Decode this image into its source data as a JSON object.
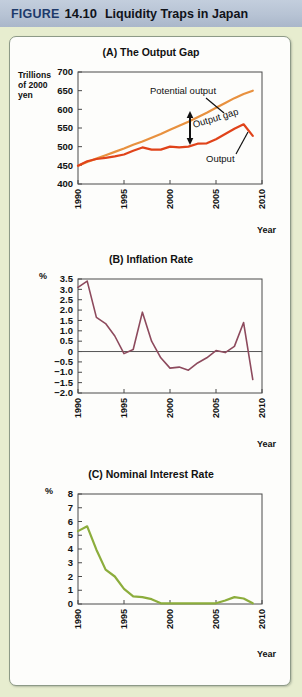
{
  "header": {
    "kicker": "FIGURE",
    "number": "14.10",
    "title": "Liquidity Traps in Japan"
  },
  "colors": {
    "header_band": "#b7c3d4",
    "page_background": "#e7edcf",
    "panel_background": "#fdfdfb",
    "potential_output_line": "#e8913f",
    "output_line": "#e0431a",
    "inflation_line": "#8d4a5d",
    "interest_line": "#8cad3c",
    "axis": "#4a4a4a",
    "zero_line": "#555555"
  },
  "chart_data": [
    {
      "type": "line",
      "id": "output-gap",
      "title": "(A) The Output Gap",
      "ylabel": "Trillions of 2000 yen",
      "ylabel_lines": [
        "Trillions",
        "of 2000",
        "yen"
      ],
      "xlabel": "Year",
      "ylim": [
        400,
        700
      ],
      "yticks": [
        400,
        450,
        500,
        550,
        600,
        650,
        700
      ],
      "xlim": [
        1990,
        2010
      ],
      "xticks": [
        1990,
        1995,
        2000,
        2005,
        2010
      ],
      "xtick_labels": [
        "1990",
        "1995",
        "2000",
        "2005",
        "2010"
      ],
      "grid": false,
      "legend": "inline-annotations",
      "annotations": [
        {
          "text": "Potential output",
          "x": 1996.5,
          "y": 648
        },
        {
          "text": "Output gap",
          "x": 2002.0,
          "y": 556
        },
        {
          "text": "Output",
          "x": 2005.0,
          "y": 492
        }
      ],
      "x": [
        1990,
        1991,
        1992,
        1993,
        1994,
        1995,
        1996,
        1997,
        1998,
        1999,
        2000,
        2001,
        2002,
        2003,
        2004,
        2005,
        2006,
        2007,
        2008,
        2009
      ],
      "series": [
        {
          "name": "Potential output",
          "color": "#e8913f",
          "values": [
            449,
            459,
            468,
            477,
            486,
            495,
            505,
            514,
            524,
            534,
            545,
            556,
            567,
            579,
            591,
            604,
            617,
            630,
            641,
            650
          ]
        },
        {
          "name": "Output",
          "color": "#e0431a",
          "values": [
            449,
            461,
            467,
            470,
            474,
            479,
            489,
            498,
            492,
            492,
            500,
            498,
            500,
            508,
            509,
            520,
            534,
            548,
            560,
            529
          ]
        }
      ]
    },
    {
      "type": "line",
      "id": "inflation-rate",
      "title": "(B) Inflation Rate",
      "ylabel": "%",
      "xlabel": "Year",
      "ylim": [
        -2.0,
        3.5
      ],
      "yticks": [
        3.5,
        3.0,
        2.5,
        2.0,
        1.5,
        1.0,
        0.5,
        0,
        -0.5,
        -1.0,
        -1.5,
        -2.0
      ],
      "ytick_labels": [
        "3.5",
        "3.0",
        "2.5",
        "2.0",
        "1.5",
        "1.0",
        "0.5",
        "0",
        "−0.5",
        "−1.0",
        "−1.5",
        "−2.0"
      ],
      "xlim": [
        1990,
        2010
      ],
      "xticks": [
        1990,
        1995,
        2000,
        2005,
        2010
      ],
      "xtick_labels": [
        "1990",
        "1995",
        "2000",
        "2005",
        "2010"
      ],
      "grid": false,
      "zero_line": true,
      "x": [
        1990,
        1991,
        1992,
        1993,
        1994,
        1995,
        1996,
        1997,
        1998,
        1999,
        2000,
        2001,
        2002,
        2003,
        2004,
        2005,
        2006,
        2007,
        2008,
        2009
      ],
      "series": [
        {
          "name": "Inflation rate",
          "color": "#8d4a5d",
          "values": [
            3.1,
            3.4,
            1.65,
            1.35,
            0.75,
            -0.1,
            0.1,
            1.9,
            0.5,
            -0.3,
            -0.8,
            -0.75,
            -0.9,
            -0.55,
            -0.3,
            0.05,
            -0.05,
            0.25,
            1.4,
            -1.35
          ]
        }
      ]
    },
    {
      "type": "line",
      "id": "nominal-interest-rate",
      "title": "(C) Nominal Interest Rate",
      "ylabel": "%",
      "xlabel": "Year",
      "ylim": [
        0,
        8
      ],
      "yticks": [
        0,
        1,
        2,
        3,
        4,
        5,
        6,
        7,
        8
      ],
      "xlim": [
        1990,
        2010
      ],
      "xticks": [
        1990,
        1995,
        2000,
        2005,
        2010
      ],
      "xtick_labels": [
        "1990",
        "1995",
        "2000",
        "2005",
        "2010"
      ],
      "grid": false,
      "x": [
        1990,
        1991,
        1992,
        1993,
        1994,
        1995,
        1996,
        1997,
        1998,
        1999,
        2000,
        2001,
        2002,
        2003,
        2004,
        2005,
        2006,
        2007,
        2008,
        2009
      ],
      "series": [
        {
          "name": "Nominal interest rate",
          "color": "#8cad3c",
          "values": [
            5.3,
            5.65,
            3.95,
            2.5,
            2.0,
            1.1,
            0.55,
            0.5,
            0.35,
            0.05,
            0.05,
            0.05,
            0.05,
            0.05,
            0.05,
            0.05,
            0.25,
            0.5,
            0.4,
            0.05
          ]
        }
      ]
    }
  ]
}
